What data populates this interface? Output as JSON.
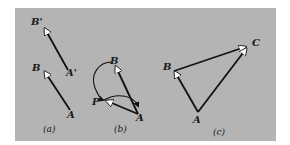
{
  "figure": {
    "background_color": "#b4b4b4",
    "line_color": "#111111",
    "arrowhead_fill": "#ffffff",
    "panels": [
      {
        "caption": "(a)",
        "labels": {
          "B_prime": "B'",
          "A_prime": "A'",
          "B": "B",
          "A": "A"
        },
        "vectors": [
          {
            "from": "A'",
            "to": "B'"
          },
          {
            "from": "A",
            "to": "B"
          }
        ]
      },
      {
        "caption": "(b)",
        "labels": {
          "B": "B",
          "P": "P",
          "A": "A"
        },
        "vectors": [
          {
            "from": "A",
            "to": "B"
          },
          {
            "from": "A",
            "to": "P"
          }
        ],
        "curved_paths": [
          {
            "from": "B",
            "to": "P",
            "via": "left arc"
          },
          {
            "from": "P",
            "to": "A",
            "via": "upper arc"
          }
        ]
      },
      {
        "caption": "(c)",
        "labels": {
          "B": "B",
          "C": "C",
          "A": "A"
        },
        "vectors": [
          {
            "from": "A",
            "to": "B"
          },
          {
            "from": "B",
            "to": "C"
          },
          {
            "from": "A",
            "to": "C"
          }
        ]
      }
    ]
  }
}
